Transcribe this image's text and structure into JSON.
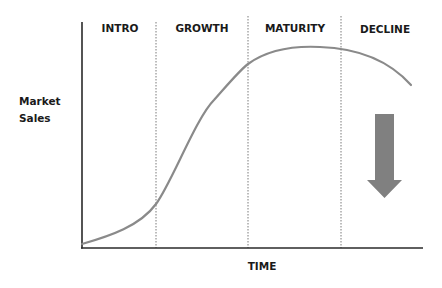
{
  "diagram": {
    "y_axis_label_line1": "Market",
    "y_axis_label_line2": "Sales",
    "x_axis_label": "TIME",
    "stages": [
      {
        "label": "INTRO"
      },
      {
        "label": "GROWTH"
      },
      {
        "label": "MATURITY"
      },
      {
        "label": "DECLINE"
      }
    ],
    "curve_description": "Sales curve rising slowly in Intro, steeply in Growth, peaking in Maturity, falling in Decline",
    "arrow": "down-arrow",
    "colors": {
      "curve": "#8a8a8a",
      "arrow": "#808080",
      "axis": "#2a2a2a",
      "divider": "#7a7a7a",
      "text": "#1a1a1a"
    }
  }
}
